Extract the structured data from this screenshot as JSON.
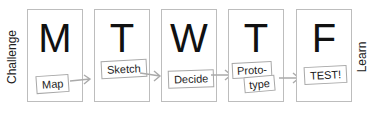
{
  "left_label": "Challenge",
  "right_label": "Learn",
  "colors": {
    "border": "#bdbdbd",
    "text": "#111111",
    "arrow": "#aaaaaa"
  },
  "steps": [
    {
      "day": "M",
      "activity": "Map"
    },
    {
      "day": "T",
      "activity": "Sketch"
    },
    {
      "day": "W",
      "activity": "Decide"
    },
    {
      "day": "T",
      "activity_line1": "Proto-",
      "activity_line2": "type"
    },
    {
      "day": "F",
      "activity": "TEST!"
    }
  ]
}
